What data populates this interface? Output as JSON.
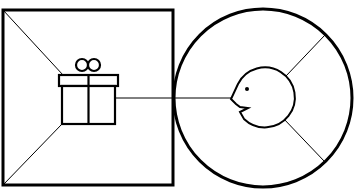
{
  "diagram": {
    "colors": {
      "stroke": "#000000",
      "background": "#ffffff"
    },
    "nodes": [
      {
        "id": "square",
        "shape": "square",
        "icon": "gift-icon"
      },
      {
        "id": "circle",
        "shape": "circle",
        "icon": "face-icon"
      }
    ],
    "edges": [
      {
        "from": "gift-icon",
        "to": "face-icon"
      }
    ]
  }
}
